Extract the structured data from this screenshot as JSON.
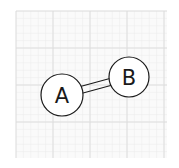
{
  "diagram": {
    "type": "graph",
    "background": "#ffffff",
    "grid": {
      "x": 16,
      "y": 11,
      "width": 151,
      "height": 147,
      "minor_step": 7.4,
      "major_step": 37,
      "minor_color": "#ececec",
      "major_color": "#dcdcdc"
    },
    "nodes": [
      {
        "id": "A",
        "label": "A",
        "cx": 62,
        "cy": 95,
        "r": 21
      },
      {
        "id": "B",
        "label": "B",
        "cx": 129,
        "cy": 77,
        "r": 20
      }
    ],
    "edges": [
      {
        "from": "A",
        "to": "B",
        "style": "double"
      }
    ],
    "stroke_color": "#1a1a1a"
  }
}
